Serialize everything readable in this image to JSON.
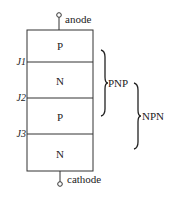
{
  "diagram": {
    "terminals": {
      "top": "anode",
      "bottom": "cathode"
    },
    "layers": [
      {
        "label": "P"
      },
      {
        "label": "N"
      },
      {
        "label": "P"
      },
      {
        "label": "N"
      }
    ],
    "junctions": [
      {
        "label": "J1"
      },
      {
        "label": "J2"
      },
      {
        "label": "J3"
      }
    ],
    "groupings": [
      {
        "label": "PNP",
        "spans_layers": "1-3"
      },
      {
        "label": "NPN",
        "spans_layers": "2-4"
      }
    ],
    "colors": {
      "line": "#333333",
      "text": "#222222",
      "background": "#ffffff"
    }
  }
}
